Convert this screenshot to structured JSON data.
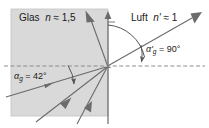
{
  "figure": {
    "type": "optics-ray-diagram",
    "colors": {
      "glass_fill": "#d9d9d9",
      "glass_border": "#bfbfbf",
      "ray": "#6b6b6b",
      "normal": "#6b6b6b",
      "interface": "#8c8c8c",
      "text": "#1a1a1a",
      "background": "#ffffff"
    },
    "media": {
      "left": {
        "name": "Glas",
        "symbol": "n",
        "relation": "≈",
        "value": "1,5",
        "full": "Glas  n ≈ 1,5"
      },
      "right": {
        "name": "Luft",
        "symbol": "n'",
        "relation": "≈",
        "value": "1",
        "full": "Luft  n' ≈ 1"
      }
    },
    "angles": [
      {
        "id": "alpha-g",
        "symbol": "α",
        "subscript": "g",
        "prime": "",
        "equals": "=",
        "value": "42°",
        "side": "glass",
        "description": "Grenzwinkel der Totalreflexion im Glas"
      },
      {
        "id": "alpha-g-prime",
        "symbol": "α",
        "subscript": "g",
        "prime": "'",
        "equals": "=",
        "value": "90°",
        "side": "air",
        "description": "Brechungswinkel in Luft bei Grenzwinkel"
      }
    ],
    "geometry": {
      "origin_x": 108,
      "origin_y": 66,
      "interface_y": 66,
      "normal_x": 108
    },
    "elements": {
      "glass_region": "glass-medium-region",
      "interface_line": "interface-dashed-line",
      "normal_line": "surface-normal-line",
      "incident_rays": 3,
      "reflected_rays": 1,
      "refracted_rays": 1,
      "arcs": 2
    }
  }
}
